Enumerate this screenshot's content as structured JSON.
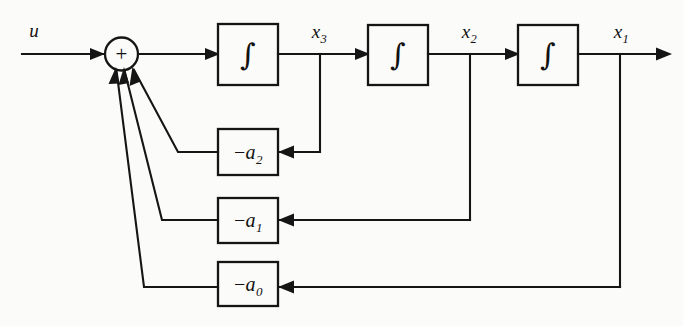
{
  "diagram": {
    "background_color": "#fbfbf9",
    "line_color": "#151515",
    "input": {
      "label": "u",
      "name": "input-signal-u"
    },
    "summing_junction": {
      "sign_label": "+",
      "name": "summing-junction"
    },
    "integrators": [
      {
        "glyph": "∫",
        "output_label": "x",
        "output_subscript": "3"
      },
      {
        "glyph": "∫",
        "output_label": "x",
        "output_subscript": "2"
      },
      {
        "glyph": "∫",
        "output_label": "x",
        "output_subscript": "1"
      }
    ],
    "gain_blocks": [
      {
        "minus": "−",
        "coefficient": "a",
        "subscript": "2",
        "source_signal": "x3"
      },
      {
        "minus": "−",
        "coefficient": "a",
        "subscript": "1",
        "source_signal": "x2"
      },
      {
        "minus": "−",
        "coefficient": "a",
        "subscript": "0",
        "source_signal": "x1"
      }
    ],
    "signals": {
      "x3": {
        "label": "x",
        "subscript": "3"
      },
      "x2": {
        "label": "x",
        "subscript": "2"
      },
      "x1": {
        "label": "x",
        "subscript": "1"
      }
    },
    "output": {
      "label": "x",
      "subscript": "1",
      "name": "output-signal-x1"
    }
  }
}
